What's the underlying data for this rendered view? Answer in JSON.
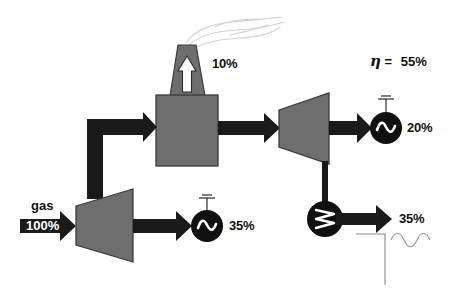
{
  "diagram": {
    "colors": {
      "body_fill": "#6e6e6e",
      "body_stroke": "#3a3a3a",
      "arrow_fill": "#1a1a1a",
      "device_fill": "#101010",
      "white": "#ffffff",
      "smoke": "#d8d8d8",
      "background": "#ffffff"
    },
    "labels": {
      "fuel_name": "gas",
      "fuel_percent": "100%",
      "stack_loss_percent": "10%",
      "gas_generator_percent": "35%",
      "steam_generator_percent": "20%",
      "heat_output_percent": "35%",
      "efficiency_symbol": "η",
      "efficiency_equals": "=",
      "efficiency_value": "55%"
    },
    "nodes": [
      {
        "name": "gas-turbine",
        "label": "gas turbine",
        "shape": "trapezoid"
      },
      {
        "name": "gas-generator",
        "label": "generator",
        "shape": "circle-sine"
      },
      {
        "name": "boiler",
        "label": "heat recovery boiler",
        "shape": "rectangle"
      },
      {
        "name": "stack",
        "label": "stack",
        "shape": "tapered-chimney"
      },
      {
        "name": "steam-turbine",
        "label": "steam turbine",
        "shape": "trapezoid"
      },
      {
        "name": "steam-generator",
        "label": "generator",
        "shape": "circle-sine"
      },
      {
        "name": "heat-exchanger",
        "label": "heat exchanger",
        "shape": "circle-zigzag"
      },
      {
        "name": "district-heating",
        "label": "district heating load",
        "shape": "line-wave"
      }
    ],
    "flows": [
      {
        "name": "gas-input",
        "from": "fuel",
        "to": "gas-turbine",
        "value": "100%"
      },
      {
        "name": "gas-turbine-shaft",
        "from": "gas-turbine",
        "to": "gas-generator",
        "value": "35%"
      },
      {
        "name": "exhaust-duct",
        "from": "gas-turbine",
        "to": "boiler",
        "value": ""
      },
      {
        "name": "stack-loss",
        "from": "boiler",
        "to": "stack",
        "value": "10%"
      },
      {
        "name": "steam-line",
        "from": "boiler",
        "to": "steam-turbine",
        "value": ""
      },
      {
        "name": "steam-turbine-shaft",
        "from": "steam-turbine",
        "to": "steam-generator",
        "value": "20%"
      },
      {
        "name": "condenser-line",
        "from": "steam-turbine",
        "to": "heat-exchanger",
        "value": ""
      },
      {
        "name": "heat-output",
        "from": "heat-exchanger",
        "to": "district-heating",
        "value": "35%"
      }
    ]
  }
}
